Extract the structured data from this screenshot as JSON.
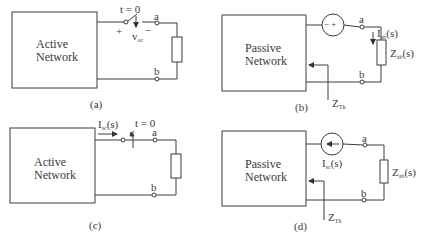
{
  "panels": {
    "a": {
      "caption": "(a)",
      "network_line1": "Active",
      "network_line2": "Network",
      "switch_label": "t = 0",
      "voltage_label": "v",
      "voltage_sub": "oc",
      "plus": "+",
      "minus": "−",
      "terminal_a": "a",
      "terminal_b": "b"
    },
    "b": {
      "caption": "(b)",
      "network_line1": "Passive",
      "network_line2": "Network",
      "source_symbol": "−  +",
      "current_label": "I",
      "current_sub": "ab",
      "current_suffix": "(s)",
      "impedance_label": "Z",
      "impedance_sub": "ab",
      "impedance_suffix": "(s)",
      "thevenin_label": "Z",
      "thevenin_sub": "Th",
      "terminal_a": "a",
      "terminal_b": "b"
    },
    "c": {
      "caption": "(c)",
      "network_line1": "Active",
      "network_line2": "Network",
      "current_label": "I",
      "current_sub": "sc",
      "current_suffix": "(s)",
      "switch_label": "t = 0",
      "terminal_a": "a",
      "terminal_b": "b"
    },
    "d": {
      "caption": "(d)",
      "network_line1": "Passive",
      "network_line2": "Network",
      "source_label": "I",
      "source_sub": "sc",
      "source_suffix": "(s)",
      "impedance_label": "Z",
      "impedance_sub": "ab",
      "impedance_suffix": "(s)",
      "thevenin_label": "Z",
      "thevenin_sub": "Th",
      "terminal_a": "a",
      "terminal_b": "b"
    }
  },
  "colors": {
    "line": "#3c3c3c",
    "background": "#ffffff"
  }
}
